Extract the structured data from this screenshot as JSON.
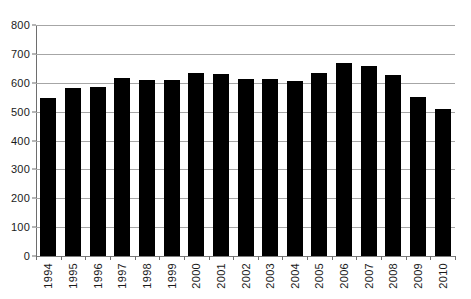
{
  "chart_data": {
    "type": "bar",
    "title": "",
    "subtitle": "",
    "xlabel": "",
    "ylabel": "",
    "categories": [
      "1994",
      "1995",
      "1996",
      "1997",
      "1998",
      "1999",
      "2000",
      "2001",
      "2002",
      "2003",
      "2004",
      "2005",
      "2006",
      "2007",
      "2008",
      "2009",
      "2010"
    ],
    "values": [
      548,
      583,
      585,
      615,
      608,
      609,
      633,
      629,
      613,
      612,
      607,
      634,
      668,
      659,
      628,
      549,
      509
    ],
    "series": [
      {
        "name": "",
        "values": [
          548,
          583,
          585,
          615,
          608,
          609,
          633,
          629,
          613,
          612,
          607,
          634,
          668,
          659,
          628,
          549,
          509
        ]
      }
    ],
    "ylim": [
      0,
      800
    ],
    "ytick_step": 100,
    "yticks": [
      0,
      100,
      200,
      300,
      400,
      500,
      600,
      700,
      800
    ],
    "ytick_labels": [
      "0",
      "100",
      "200",
      "300",
      "400",
      "500",
      "600",
      "700",
      "800"
    ],
    "xtick_labels": [
      "1994",
      "1995",
      "1996",
      "1997",
      "1998",
      "1999",
      "2000",
      "2001",
      "2002",
      "2003",
      "2004",
      "2005",
      "2006",
      "2007",
      "2008",
      "2009",
      "2010"
    ],
    "grid": true,
    "grid_axis": "y",
    "legend": false,
    "legend_position": "none",
    "bar_color": "#000000",
    "grid_color": "#a6a6a6",
    "axis_color": "#6e6e6e",
    "background_color": "#ffffff",
    "annotations": []
  }
}
